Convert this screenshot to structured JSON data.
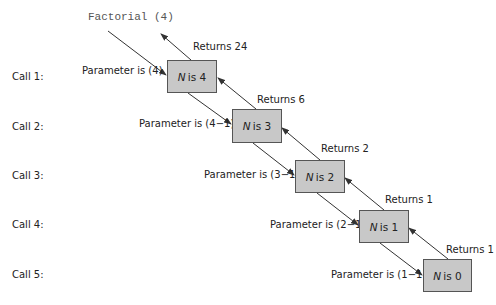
{
  "diagram": {
    "title": "Factorial (4)",
    "calls": [
      {
        "call_label": "Call 1:",
        "param_label": "Parameter is (4)",
        "var": "N",
        "box_text": "is 4",
        "return_label": "Returns 24"
      },
      {
        "call_label": "Call 2:",
        "param_label": "Parameter is (4−1)",
        "var": "N",
        "box_text": "is 3",
        "return_label": "Returns 6"
      },
      {
        "call_label": "Call 3:",
        "param_label": "Parameter is (3−1)",
        "var": "N",
        "box_text": "is 2",
        "return_label": "Returns 2"
      },
      {
        "call_label": "Call 4:",
        "param_label": "Parameter is (2−1)",
        "var": "N",
        "box_text": "is 1",
        "return_label": "Returns 1"
      },
      {
        "call_label": "Call 5:",
        "param_label": "Parameter is (1−1)",
        "var": "N",
        "box_text": "is 0",
        "return_label": "Returns 1"
      }
    ],
    "colors": {
      "box_fill": "#c8c8c8",
      "box_border": "#555555",
      "arrow": "#333333",
      "text": "#222222"
    }
  }
}
